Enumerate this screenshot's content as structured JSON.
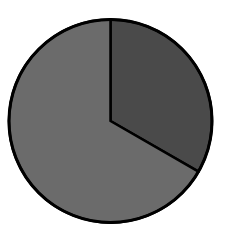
{
  "chart_data": {
    "type": "pie",
    "title": "",
    "categories": [
      "Slice A",
      "Slice B"
    ],
    "values": [
      33.3,
      66.7
    ],
    "colors": [
      "#4a4a4a",
      "#6b6b6b"
    ],
    "start_angle_deg": 0,
    "direction": "clockwise",
    "outline_color": "#000000",
    "legend": "none",
    "labels_shown": false
  },
  "layout": {
    "cx": 110.5,
    "cy": 121,
    "r": 101.5
  }
}
